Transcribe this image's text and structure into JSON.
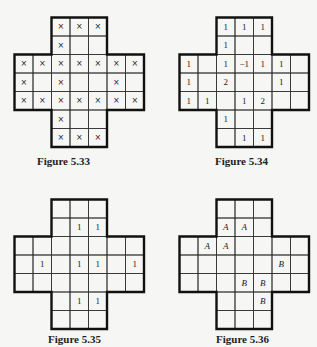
{
  "cell_size": 18.5,
  "shape_cells": [
    [
      0,
      2
    ],
    [
      0,
      3
    ],
    [
      0,
      4
    ],
    [
      1,
      2
    ],
    [
      1,
      3
    ],
    [
      1,
      4
    ],
    [
      2,
      0
    ],
    [
      2,
      1
    ],
    [
      2,
      2
    ],
    [
      2,
      3
    ],
    [
      2,
      4
    ],
    [
      2,
      5
    ],
    [
      2,
      6
    ],
    [
      3,
      0
    ],
    [
      3,
      1
    ],
    [
      3,
      2
    ],
    [
      3,
      3
    ],
    [
      3,
      4
    ],
    [
      3,
      5
    ],
    [
      3,
      6
    ],
    [
      4,
      0
    ],
    [
      4,
      1
    ],
    [
      4,
      2
    ],
    [
      4,
      3
    ],
    [
      4,
      4
    ],
    [
      4,
      5
    ],
    [
      4,
      6
    ],
    [
      5,
      2
    ],
    [
      5,
      3
    ],
    [
      5,
      4
    ],
    [
      6,
      2
    ],
    [
      6,
      3
    ],
    [
      6,
      4
    ]
  ],
  "figures": [
    {
      "caption": "Figure 5.33",
      "left": 13,
      "top": 16,
      "caption_left": 37,
      "caption_top": 155,
      "style": "x",
      "entries": [
        {
          "r": 0,
          "c": 2,
          "v": "×"
        },
        {
          "r": 0,
          "c": 3,
          "v": "×"
        },
        {
          "r": 0,
          "c": 4,
          "v": "×"
        },
        {
          "r": 1,
          "c": 2,
          "v": "×"
        },
        {
          "r": 2,
          "c": 0,
          "v": "×"
        },
        {
          "r": 2,
          "c": 1,
          "v": "×"
        },
        {
          "r": 2,
          "c": 2,
          "v": "×"
        },
        {
          "r": 2,
          "c": 3,
          "v": "×"
        },
        {
          "r": 2,
          "c": 4,
          "v": "×"
        },
        {
          "r": 2,
          "c": 5,
          "v": "×"
        },
        {
          "r": 2,
          "c": 6,
          "v": "×"
        },
        {
          "r": 3,
          "c": 0,
          "v": "×"
        },
        {
          "r": 3,
          "c": 2,
          "v": "×"
        },
        {
          "r": 3,
          "c": 5,
          "v": "×"
        },
        {
          "r": 4,
          "c": 0,
          "v": "×"
        },
        {
          "r": 4,
          "c": 1,
          "v": "×"
        },
        {
          "r": 4,
          "c": 2,
          "v": "×"
        },
        {
          "r": 4,
          "c": 3,
          "v": "×"
        },
        {
          "r": 4,
          "c": 4,
          "v": "×"
        },
        {
          "r": 4,
          "c": 5,
          "v": "×"
        },
        {
          "r": 4,
          "c": 6,
          "v": "×"
        },
        {
          "r": 5,
          "c": 2,
          "v": "×"
        },
        {
          "r": 6,
          "c": 2,
          "v": "×"
        },
        {
          "r": 6,
          "c": 3,
          "v": "×"
        },
        {
          "r": 6,
          "c": 4,
          "v": "×"
        }
      ]
    },
    {
      "caption": "Figure 5.34",
      "left": 178,
      "top": 16,
      "caption_left": 215,
      "caption_top": 155,
      "style": "num",
      "entries": [
        {
          "r": 0,
          "c": 2,
          "v": "1"
        },
        {
          "r": 0,
          "c": 3,
          "v": "1"
        },
        {
          "r": 0,
          "c": 4,
          "v": "1"
        },
        {
          "r": 1,
          "c": 2,
          "v": "1"
        },
        {
          "r": 2,
          "c": 0,
          "v": "1"
        },
        {
          "r": 2,
          "c": 2,
          "v": "1"
        },
        {
          "r": 2,
          "c": 3,
          "v": "−1"
        },
        {
          "r": 2,
          "c": 4,
          "v": "1"
        },
        {
          "r": 2,
          "c": 5,
          "v": "1"
        },
        {
          "r": 3,
          "c": 0,
          "v": "1"
        },
        {
          "r": 3,
          "c": 2,
          "v": "2"
        },
        {
          "r": 3,
          "c": 5,
          "v": "1"
        },
        {
          "r": 4,
          "c": 0,
          "v": "1"
        },
        {
          "r": 4,
          "c": 1,
          "v": "1"
        },
        {
          "r": 4,
          "c": 3,
          "v": "1"
        },
        {
          "r": 4,
          "c": 4,
          "v": "2"
        },
        {
          "r": 5,
          "c": 2,
          "v": "1"
        },
        {
          "r": 6,
          "c": 3,
          "v": "1"
        },
        {
          "r": 6,
          "c": 4,
          "v": "1"
        }
      ]
    },
    {
      "caption": "Figure 5.35",
      "left": 13,
      "top": 198,
      "caption_left": 48,
      "caption_top": 333,
      "style": "num",
      "entries": [
        {
          "r": 1,
          "c": 3,
          "v": "1"
        },
        {
          "r": 1,
          "c": 4,
          "v": "1"
        },
        {
          "r": 3,
          "c": 1,
          "v": "1"
        },
        {
          "r": 3,
          "c": 3,
          "v": "1"
        },
        {
          "r": 3,
          "c": 4,
          "v": "1"
        },
        {
          "r": 3,
          "c": 6,
          "v": "1"
        },
        {
          "r": 5,
          "c": 3,
          "v": "1"
        },
        {
          "r": 5,
          "c": 4,
          "v": "1"
        }
      ]
    },
    {
      "caption": "Figure 5.36",
      "left": 178,
      "top": 198,
      "caption_left": 216,
      "caption_top": 333,
      "style": "it",
      "entries": [
        {
          "r": 1,
          "c": 2,
          "v": "A"
        },
        {
          "r": 1,
          "c": 3,
          "v": "A"
        },
        {
          "r": 2,
          "c": 1,
          "v": "A"
        },
        {
          "r": 2,
          "c": 2,
          "v": "A"
        },
        {
          "r": 3,
          "c": 5,
          "v": "B"
        },
        {
          "r": 4,
          "c": 3,
          "v": "B"
        },
        {
          "r": 4,
          "c": 4,
          "v": "B"
        },
        {
          "r": 5,
          "c": 4,
          "v": "B"
        }
      ]
    }
  ]
}
